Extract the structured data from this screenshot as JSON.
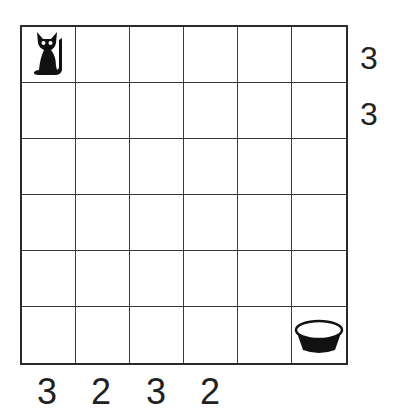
{
  "puzzle": {
    "rows": 6,
    "cols": 6,
    "pieces": [
      {
        "name": "cat",
        "icon": "cat-icon",
        "row": 0,
        "col": 0
      },
      {
        "name": "bowl",
        "icon": "bowl-icon",
        "row": 5,
        "col": 5
      }
    ],
    "row_clues": [
      "3",
      "3",
      "",
      "",
      "",
      ""
    ],
    "col_clues": [
      "3",
      "2",
      "3",
      "2",
      "",
      ""
    ]
  }
}
